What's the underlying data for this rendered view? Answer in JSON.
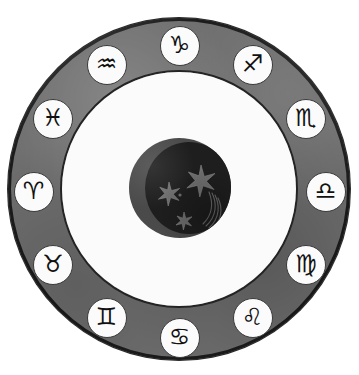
{
  "figure": {
    "background_color": "#ffffff",
    "ring_color": "#6f6f6f",
    "ring_outline_color": "#1c1c1c",
    "inner_field_color": "#fbfbfb",
    "medallion_fill": "#fbfbfb",
    "medallion_outline": "#3a3a3a",
    "glyph_color": "#111111",
    "center_outer_color": "#4a4a4a",
    "center_moon_color": "#1e1e1e",
    "star_color": "#6a6a6a"
  },
  "center": {
    "motif_label": "crescent moon with stars and comet",
    "star_count": 3,
    "star_points": 6,
    "has_comet_streak": true
  },
  "wheel": {
    "sign_count": 12,
    "order_description": "clockwise from top",
    "signs": [
      {
        "name": "Capricorn",
        "glyph": "♑",
        "angle_deg": 0,
        "position": "top"
      },
      {
        "name": "Sagittarius",
        "glyph": "♐",
        "angle_deg": 30,
        "position": "top-right"
      },
      {
        "name": "Scorpio",
        "glyph": "♏",
        "angle_deg": 60,
        "position": "upper-right"
      },
      {
        "name": "Libra",
        "glyph": "♎",
        "angle_deg": 90,
        "position": "right"
      },
      {
        "name": "Virgo",
        "glyph": "♍",
        "angle_deg": 120,
        "position": "lower-right"
      },
      {
        "name": "Leo",
        "glyph": "♌",
        "angle_deg": 150,
        "position": "bottom-right"
      },
      {
        "name": "Cancer",
        "glyph": "♋",
        "angle_deg": 180,
        "position": "bottom"
      },
      {
        "name": "Gemini",
        "glyph": "♊",
        "angle_deg": 210,
        "position": "bottom-left"
      },
      {
        "name": "Taurus",
        "glyph": "♉",
        "angle_deg": 240,
        "position": "lower-left"
      },
      {
        "name": "Aries",
        "glyph": "♈",
        "angle_deg": 270,
        "position": "left"
      },
      {
        "name": "Pisces",
        "glyph": "♓",
        "angle_deg": 300,
        "position": "upper-left"
      },
      {
        "name": "Aquarius",
        "glyph": "♒",
        "angle_deg": 330,
        "position": "top-left"
      }
    ]
  }
}
